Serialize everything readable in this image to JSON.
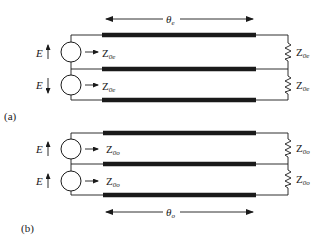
{
  "diagram": {
    "colors": {
      "ink": "#1a1a1a",
      "background": "#ffffff"
    },
    "panels": [
      {
        "id": "a",
        "label": "(a)",
        "length_label": {
          "main": "θ",
          "sub": "e"
        },
        "sources": [
          {
            "voltage": "E",
            "direction": "up",
            "impedance": {
              "main": "Z",
              "sub": "0e"
            }
          },
          {
            "voltage": "E",
            "direction": "down",
            "impedance": {
              "main": "Z",
              "sub": "0e"
            }
          }
        ],
        "loads": [
          {
            "impedance": {
              "main": "Z",
              "sub": "0e"
            }
          },
          {
            "impedance": {
              "main": "Z",
              "sub": "0e"
            }
          }
        ]
      },
      {
        "id": "b",
        "label": "(b)",
        "length_label": {
          "main": "θ",
          "sub": "o"
        },
        "sources": [
          {
            "voltage": "E",
            "direction": "up",
            "impedance": {
              "main": "Z",
              "sub": "0o"
            }
          },
          {
            "voltage": "E",
            "direction": "up",
            "impedance": {
              "main": "Z",
              "sub": "0o"
            }
          }
        ],
        "loads": [
          {
            "impedance": {
              "main": "Z",
              "sub": "0o"
            }
          },
          {
            "impedance": {
              "main": "Z",
              "sub": "0o"
            }
          }
        ]
      }
    ]
  }
}
